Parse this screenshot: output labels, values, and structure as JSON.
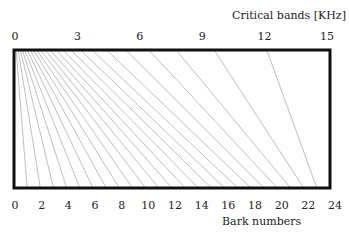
{
  "chart_data": {
    "type": "diagram",
    "title": "",
    "top_axis": {
      "label": "Critical bands [KHz]",
      "ticks": [
        "0",
        "3",
        "6",
        "9",
        "12",
        "15"
      ],
      "range": [
        0,
        15
      ]
    },
    "bottom_axis": {
      "label": "Bark numbers",
      "ticks": [
        "0",
        "2",
        "4",
        "6",
        "8",
        "10",
        "12",
        "14",
        "16",
        "18",
        "20",
        "22",
        "24"
      ],
      "range": [
        0,
        24
      ]
    },
    "band_edges_hz": [
      0,
      100,
      200,
      300,
      400,
      510,
      630,
      770,
      920,
      1080,
      1270,
      1480,
      1720,
      2000,
      2320,
      2700,
      3150,
      3700,
      4400,
      5300,
      6400,
      7700,
      9500,
      12000
    ],
    "bark_values": [
      0,
      1,
      2,
      3,
      4,
      5,
      6,
      7,
      8,
      9,
      10,
      11,
      12,
      13,
      14,
      15,
      16,
      17,
      18,
      19,
      20,
      21,
      22,
      23
    ],
    "colors": {
      "frame": "#111111",
      "lines": "#b8b8b8"
    }
  },
  "labels": {
    "top_axis_title": "Critical bands [KHz]",
    "bottom_axis_title": "Bark numbers"
  }
}
